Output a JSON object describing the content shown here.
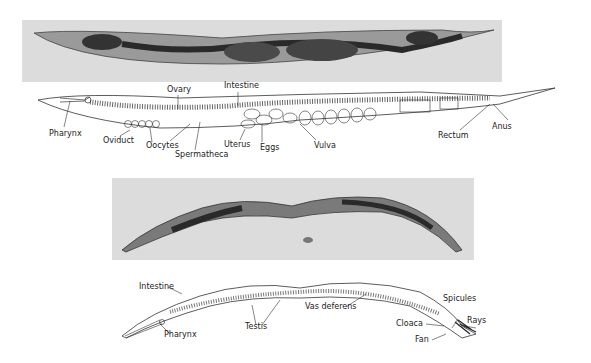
{
  "figure": {
    "panels": [
      {
        "id": "hermaphrodite-photo",
        "kind": "micrograph"
      },
      {
        "id": "hermaphrodite-drawing",
        "kind": "line-drawing",
        "labels": [
          "Ovary",
          "Intestine",
          "Pharynx",
          "Oviduct",
          "Oocytes",
          "Spermatheca",
          "Uterus",
          "Eggs",
          "Vulva",
          "Rectum",
          "Anus"
        ]
      },
      {
        "id": "male-photo",
        "kind": "micrograph"
      },
      {
        "id": "male-drawing",
        "kind": "line-drawing",
        "labels": [
          "Intestine",
          "Pharynx",
          "Testis",
          "Vas deferens",
          "Spicules",
          "Cloaca",
          "Rays",
          "Fan"
        ]
      }
    ]
  },
  "herm": {
    "ovary": "Ovary",
    "intestine": "Intestine",
    "pharynx": "Pharynx",
    "oviduct": "Oviduct",
    "oocytes": "Oocytes",
    "spermatheca": "Spermatheca",
    "uterus": "Uterus",
    "eggs": "Eggs",
    "vulva": "Vulva",
    "rectum": "Rectum",
    "anus": "Anus"
  },
  "male": {
    "intestine": "Intestine",
    "pharynx": "Pharynx",
    "testis": "Testis",
    "vas_deferens": "Vas deferens",
    "spicules": "Spicules",
    "cloaca": "Cloaca",
    "rays": "Rays",
    "fan": "Fan"
  }
}
